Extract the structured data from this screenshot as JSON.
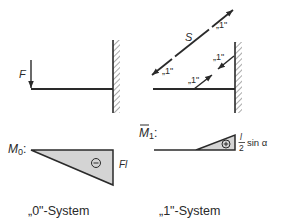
{
  "diagram": {
    "type": "structural-mechanics-unit-load-method",
    "colors": {
      "line": "#2a2a2a",
      "moment_fill": "#d4d4d4",
      "background": "#ffffff"
    },
    "system_0": {
      "caption": "„0\"-System",
      "force_label": "F",
      "moment_label_main": "M",
      "moment_label_sub": "0",
      "moment_label_colon": ":",
      "moment_sign": "−",
      "moment_value": "Fl"
    },
    "system_1": {
      "caption": "„1\"-System",
      "rod_label": "S",
      "unit_labels": [
        "„1\"",
        "„1\"",
        "„1\"",
        "„1\""
      ],
      "moment_label_main": "M",
      "moment_label_bar": "‾",
      "moment_label_sub": "1",
      "moment_label_colon": ":",
      "moment_sign": "+",
      "moment_value_num": "l",
      "moment_value_den": "2",
      "moment_value_suffix": "sin α"
    }
  }
}
